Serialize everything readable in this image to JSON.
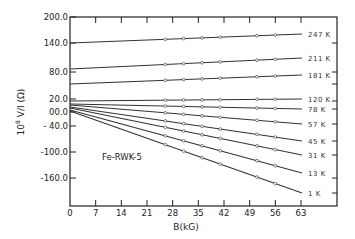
{
  "chart_data": {
    "type": "line",
    "title": "",
    "annotation": "Fe-RWK-5",
    "xlabel": "B(kG)",
    "ylabel": "10^8 V/I (Ω)",
    "ylabel_parts": {
      "prefix": "10",
      "exp": "8",
      "rest": " V/I (Ω)"
    },
    "xlim": [
      0,
      63
    ],
    "ylim": [
      -200,
      200
    ],
    "x_ticks": [
      0,
      7,
      14,
      21,
      28,
      35,
      42,
      49,
      56,
      63
    ],
    "x_tick_labels": [
      "0",
      "7",
      "14",
      "21",
      "28",
      "35",
      "42",
      "49",
      "56",
      "63"
    ],
    "y_ticks": [
      {
        "label": "200.0",
        "py": 17
      },
      {
        "label": "140.0",
        "py": 43
      },
      {
        "label": "80.0",
        "py": 72
      },
      {
        "label": "20.0",
        "py": 99
      },
      {
        "label": "00.0",
        "py": 112
      },
      {
        "label": "- 40.0",
        "py": 126
      },
      {
        "label": "-100.0",
        "py": 152
      },
      {
        "label": "-160.0",
        "py": 178
      }
    ],
    "grid": false,
    "legend": "inline labels at right end of each line",
    "marker_x": [
      26,
      31,
      36,
      41,
      51,
      56
    ],
    "series": [
      {
        "name": "247 K",
        "x": [
          0,
          63
        ],
        "y": [
          140,
          158
        ],
        "py": [
          43,
          34
        ]
      },
      {
        "name": "211 K",
        "x": [
          0,
          63
        ],
        "y": [
          82,
          109
        ],
        "py": [
          69,
          58
        ]
      },
      {
        "name": "181 K",
        "x": [
          0,
          63
        ],
        "y": [
          51,
          73
        ],
        "py": [
          84,
          75
        ]
      },
      {
        "name": "120 K",
        "x": [
          0,
          63
        ],
        "y": [
          15,
          20
        ],
        "py": [
          101,
          99
        ]
      },
      {
        "name": "78 K",
        "x": [
          0,
          63
        ],
        "y": [
          8,
          4
        ],
        "py": [
          104,
          109
        ]
      },
      {
        "name": "57 K",
        "x": [
          0,
          63
        ],
        "y": [
          6,
          -34
        ],
        "py": [
          105,
          124
        ]
      },
      {
        "name": "45 K",
        "x": [
          0,
          63
        ],
        "y": [
          4,
          -72
        ],
        "py": [
          107,
          141
        ]
      },
      {
        "name": "31 K",
        "x": [
          0,
          63
        ],
        "y": [
          3,
          -107
        ],
        "py": [
          108,
          155
        ]
      },
      {
        "name": "13 K",
        "x": [
          0,
          63
        ],
        "y": [
          1,
          -149
        ],
        "py": [
          110,
          173
        ]
      },
      {
        "name": "1 K",
        "x": [
          0,
          63
        ],
        "y": [
          0,
          -186
        ],
        "py": [
          111,
          193
        ]
      }
    ],
    "colors": {
      "line": "#333333",
      "axis": "#222222",
      "marker_fill": "#ffffff"
    }
  }
}
